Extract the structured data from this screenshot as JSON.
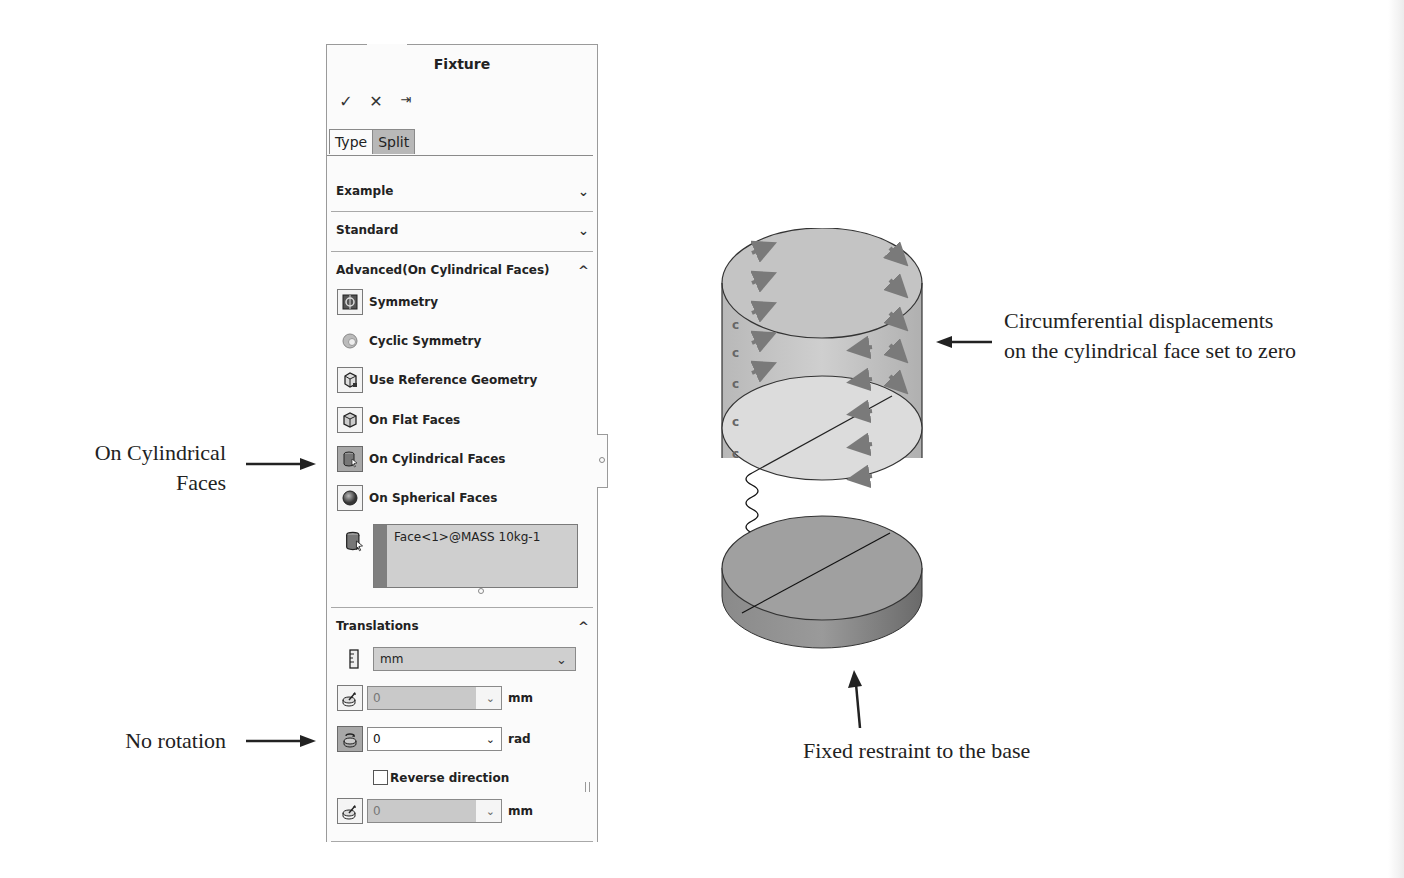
{
  "panel": {
    "title": "Fixture",
    "actions": {
      "ok": "✓",
      "cancel": "✕",
      "pin": "⇥"
    },
    "tabs": [
      {
        "label": "Type",
        "active": true
      },
      {
        "label": "Split",
        "active": false
      }
    ],
    "sections": {
      "example": {
        "label": "Example",
        "chevron": "﹀"
      },
      "standard": {
        "label": "Standard",
        "chevron": "﹀"
      },
      "advanced": {
        "label": "Advanced(On Cylindrical Faces)",
        "chevron": "︿"
      },
      "translations": {
        "label": "Translations",
        "chevron": "︿"
      }
    },
    "advanced_options": [
      {
        "label": "Symmetry",
        "icon": "symmetry-icon",
        "selected": false
      },
      {
        "label": "Cyclic Symmetry",
        "icon": "cyclic-symmetry-icon",
        "selected": false
      },
      {
        "label": "Use Reference Geometry",
        "icon": "reference-geometry-icon",
        "selected": false
      },
      {
        "label": "On Flat Faces",
        "icon": "flat-faces-icon",
        "selected": false
      },
      {
        "label": "On Cylindrical Faces",
        "icon": "cylindrical-faces-icon",
        "selected": true
      },
      {
        "label": "On Spherical Faces",
        "icon": "spherical-faces-icon",
        "selected": false
      }
    ],
    "selection": {
      "value": "Face<1>@MASS 10kg-1"
    },
    "translations": {
      "unit_select": "mm",
      "radial": {
        "value": "0",
        "unit": "mm",
        "enabled": false
      },
      "circumferential": {
        "value": "0",
        "unit": "rad",
        "enabled": true
      },
      "reverse_direction": {
        "label": "Reverse direction",
        "checked": false
      },
      "axial": {
        "value": "0",
        "unit": "mm",
        "enabled": false
      }
    },
    "colors": {
      "selected_icon_bg": "#a8a8a8",
      "selection_box_bg": "#cfcfcf",
      "selection_bar": "#7f7f7f"
    }
  },
  "annotations": {
    "cylindrical_faces": [
      "On Cylindrical",
      "Faces"
    ],
    "no_rotation": "No rotation",
    "circumferential": [
      "Circumferential displacements",
      "on the cylindrical face set to zero"
    ],
    "fixed_base": "Fixed restraint to the base"
  }
}
